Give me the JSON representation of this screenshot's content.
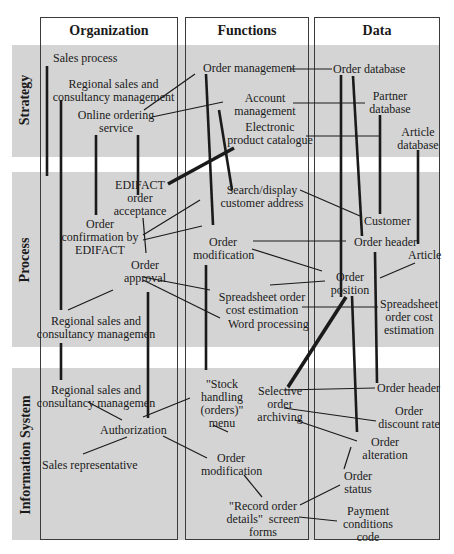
{
  "columns": [
    {
      "label": "Organization"
    },
    {
      "label": "Functions"
    },
    {
      "label": "Data"
    }
  ],
  "rows": [
    {
      "label": "Strategy"
    },
    {
      "label": "Process"
    },
    {
      "label": "Information System"
    }
  ],
  "nodes": {
    "sales_process": "Sales process",
    "regional_sales_1": "Regional sales and\nconsultancy management",
    "online_ordering": "Online ordering\nservice",
    "edifact_acceptance": "EDIFACT\norder\nacceptance",
    "order_conf_edifact": "Order\nconfirmation by\nEDIFACT",
    "order_approval": "Order\napproval",
    "regional_sales_2": "Regional sales and\nconsultancy managemen",
    "regional_sales_3": "Regional sales and\nconsultancy managemen",
    "authorization": "Authorization",
    "sales_rep": "Sales representative",
    "order_management": "Order management",
    "account_management": "Account\nmanagement",
    "electronic_catalogue": "Electronic\nproduct catalogue",
    "search_display": "Search/display\ncustomer address",
    "order_modification_1": "Order\nmodification",
    "spreadsheet_fn": "Spreadsheet order\ncost estimation",
    "word_processing": "Word processing",
    "stock_handling": "\"Stock\nhandling\n(orders)\"\nmenu",
    "order_modification_2": "Order\nmodification",
    "record_order": "\"Record order\ndetails\"  screen\nforms",
    "selective_archiving": "Selective\norder\narchiving",
    "order_database": "Order database",
    "partner_database": "Partner\ndatabase",
    "article_database": "Article\ndatabase",
    "customer": "Customer",
    "order_header_1": "Order header",
    "article": "Article",
    "order_position": "Order\nposition",
    "spreadsheet_data": "Spreadsheet\norder cost\nestimation",
    "order_header_2": "Order header",
    "order_discount": "Order\ndiscount rate",
    "order_alteration": "Order\nalteration",
    "order_status": "Order\nstatus",
    "payment_code": "Payment\nconditions\ncode"
  },
  "colors": {
    "band": "#d4d4d4",
    "border": "#3a3a3a",
    "line": "#1a1a1a"
  }
}
